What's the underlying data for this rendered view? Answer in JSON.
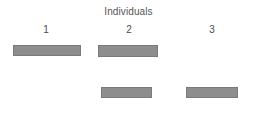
{
  "chart": {
    "title": "Individuals",
    "colors": {
      "background": "#ffffff",
      "bar_fill": "#8d8d8d",
      "bar_border": "#7a7a7a",
      "title_text": "#555555",
      "label_text": "#4a4a4a"
    },
    "columns": [
      {
        "label": "1",
        "center_x": 46
      },
      {
        "label": "2",
        "center_x": 129
      },
      {
        "label": "3",
        "center_x": 212
      }
    ]
  },
  "chart_data": {
    "type": "bar",
    "title": "Individuals",
    "xlabel": "",
    "ylabel": "",
    "orientation": "horizontal-segments",
    "categories": [
      "1",
      "2",
      "3"
    ],
    "rows": [
      "row1",
      "row2"
    ],
    "grid": false,
    "legend": null,
    "bars": [
      {
        "individual": "1",
        "row": 1,
        "x": 13,
        "y": 45,
        "width": 68,
        "height": 11,
        "present": true
      },
      {
        "individual": "2",
        "row": 1,
        "x": 98,
        "y": 45,
        "width": 60,
        "height": 12,
        "present": true
      },
      {
        "individual": "3",
        "row": 1,
        "present": false
      },
      {
        "individual": "1",
        "row": 2,
        "present": false
      },
      {
        "individual": "2",
        "row": 2,
        "x": 101,
        "y": 87,
        "width": 51,
        "height": 11,
        "present": true
      },
      {
        "individual": "3",
        "row": 2,
        "x": 186,
        "y": 87,
        "width": 52,
        "height": 11,
        "present": true
      }
    ],
    "series": [
      {
        "name": "row1",
        "categories": [
          "1",
          "2",
          "3"
        ],
        "values": [
          68,
          60,
          0
        ]
      },
      {
        "name": "row2",
        "categories": [
          "1",
          "2",
          "3"
        ],
        "values": [
          0,
          51,
          52
        ]
      }
    ]
  }
}
